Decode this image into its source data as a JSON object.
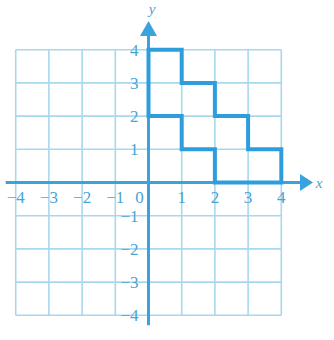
{
  "chart_data": {
    "type": "line",
    "title": "",
    "xlabel": "x",
    "ylabel": "y",
    "grid": true,
    "legend": null,
    "xlim": [
      -4,
      4
    ],
    "ylim": [
      -4,
      4
    ],
    "xticks": [
      -4,
      -3,
      -2,
      -1,
      0,
      1,
      2,
      3,
      4
    ],
    "yticks": [
      -4,
      -3,
      -2,
      -1,
      1,
      2,
      3,
      4
    ],
    "xtick_labels": [
      "−4",
      "−3",
      "−2",
      "−1",
      "0",
      "1",
      "2",
      "3",
      "4"
    ],
    "ytick_labels": [
      "−4",
      "−3",
      "−2",
      "−1",
      "1",
      "2",
      "3",
      "4"
    ],
    "series": [
      {
        "name": "staircase-polygon",
        "type": "closed-polyline",
        "closed": true,
        "points": [
          [
            0,
            2
          ],
          [
            0,
            4
          ],
          [
            1,
            4
          ],
          [
            1,
            3
          ],
          [
            2,
            3
          ],
          [
            2,
            2
          ],
          [
            3,
            2
          ],
          [
            3,
            1
          ],
          [
            4,
            1
          ],
          [
            4,
            0
          ],
          [
            2,
            0
          ],
          [
            2,
            1
          ],
          [
            1,
            1
          ],
          [
            1,
            2
          ]
        ]
      }
    ],
    "annotations": []
  },
  "axes": {
    "x_axis_label": "x",
    "y_axis_label": "y",
    "x_arrow": "right-arrow",
    "y_arrow": "up-arrow",
    "origin_label": "0"
  },
  "colors": {
    "shape_stroke": "#2e9ddb",
    "axis": "#3aa3dd",
    "grid": "#a8d8ee",
    "tick_text": "#4aa3d4",
    "background": "#ffffff"
  }
}
